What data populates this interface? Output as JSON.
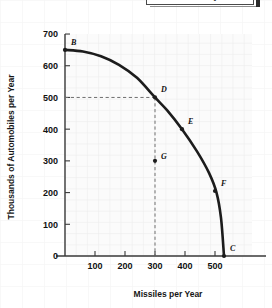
{
  "top_banner": {
    "clipped_title": "Economy",
    "visible": true
  },
  "chart_data": {
    "type": "line",
    "title": "",
    "subtitle": "",
    "xlabel": "Missiles per Year",
    "ylabel": "Thousands of Automobiles per Year",
    "xlim": [
      0,
      560
    ],
    "ylim": [
      0,
      720
    ],
    "grid": false,
    "legend": "none",
    "x_ticks": [
      100,
      200,
      300,
      400,
      500
    ],
    "x_tick_labels": [
      "100",
      "200",
      "300",
      "400",
      "500"
    ],
    "y_ticks": [
      0,
      100,
      200,
      300,
      400,
      500,
      600,
      700
    ],
    "y_tick_labels": [
      "0",
      "100",
      "200",
      "300",
      "400",
      "500",
      "600",
      "700"
    ],
    "series": [
      {
        "name": "Production Possibilities Frontier",
        "kind": "curve",
        "x": [
          0,
          60,
          120,
          180,
          240,
          300,
          340,
          390,
          440,
          480,
          505,
          520,
          530
        ],
        "y": [
          650,
          645,
          630,
          603,
          562,
          500,
          460,
          400,
          330,
          262,
          200,
          120,
          0
        ]
      }
    ],
    "points": [
      {
        "label": "B",
        "x": 0,
        "y": 650,
        "on_curve": true,
        "label_dx": 6,
        "label_dy": -5
      },
      {
        "label": "D",
        "x": 300,
        "y": 500,
        "on_curve": true,
        "label_dx": 6,
        "label_dy": -5
      },
      {
        "label": "E",
        "x": 390,
        "y": 400,
        "on_curve": true,
        "label_dx": 6,
        "label_dy": -5
      },
      {
        "label": "F",
        "x": 500,
        "y": 205,
        "on_curve": true,
        "label_dx": 6,
        "label_dy": -5
      },
      {
        "label": "C",
        "x": 530,
        "y": 0,
        "on_curve": true,
        "label_dx": 6,
        "label_dy": -5
      },
      {
        "label": "G",
        "x": 300,
        "y": 300,
        "on_curve": false,
        "label_dx": 6,
        "label_dy": -2
      }
    ],
    "annotations": [
      {
        "type": "dashed-guide",
        "from": {
          "x": 0,
          "y": 500
        },
        "to": {
          "x": 300,
          "y": 500
        }
      },
      {
        "type": "dashed-guide",
        "from": {
          "x": 300,
          "y": 500
        },
        "to": {
          "x": 300,
          "y": 0
        }
      }
    ],
    "colors": {
      "curve": "#1c1c1c",
      "axis": "#3a3a3a",
      "text": "#111111",
      "guide": "#6e6e6e",
      "plot_background": "#fbfbfb",
      "page_background": "#ffffff"
    }
  }
}
